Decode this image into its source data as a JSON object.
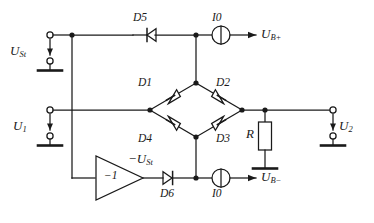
{
  "diagram": {
    "type": "circuit-schematic",
    "stroke_color": "#1a1a1a",
    "background": "#ffffff"
  },
  "labels": {
    "u_st": "U",
    "u_st_sub": "St",
    "u_1": "U",
    "u_1_sub": "1",
    "u_2": "U",
    "u_2_sub": "2",
    "u_b_plus": "U",
    "u_b_plus_sub": "B+",
    "u_b_minus": "U",
    "u_b_minus_sub": "B−",
    "minus_u_st": "−U",
    "minus_u_st_sub": "St",
    "amp_gain": "−1",
    "resistor": "R",
    "d1": "D1",
    "d2": "D2",
    "d3": "D3",
    "d4": "D4",
    "d5": "D5",
    "d6": "D6",
    "i0_top": "I0",
    "i0_bottom": "I0"
  },
  "components": [
    {
      "name": "d1",
      "kind": "diode",
      "label": "D1",
      "orientation": "down-left"
    },
    {
      "name": "d2",
      "kind": "diode",
      "label": "D2",
      "orientation": "down-right"
    },
    {
      "name": "d3",
      "kind": "diode",
      "label": "D3",
      "orientation": "up-right"
    },
    {
      "name": "d4",
      "kind": "diode",
      "label": "D4",
      "orientation": "up-left"
    },
    {
      "name": "d5",
      "kind": "diode",
      "label": "D5",
      "orientation": "left"
    },
    {
      "name": "d6",
      "kind": "diode",
      "label": "D6",
      "orientation": "right"
    },
    {
      "name": "i0-top",
      "kind": "current-source",
      "label": "I0"
    },
    {
      "name": "i0-bottom",
      "kind": "current-source",
      "label": "I0"
    },
    {
      "name": "resistor-r",
      "kind": "resistor",
      "label": "R"
    },
    {
      "name": "inverting-amplifier",
      "kind": "amplifier",
      "label": "−1"
    }
  ],
  "terminals": [
    {
      "name": "u-st-input",
      "label": "U_St",
      "side": "left"
    },
    {
      "name": "u-1-input",
      "label": "U_1",
      "side": "left"
    },
    {
      "name": "u-2-output",
      "label": "U_2",
      "side": "right"
    },
    {
      "name": "u-b-plus-output",
      "label": "U_B+",
      "side": "right"
    },
    {
      "name": "u-b-minus-output",
      "label": "U_B−",
      "side": "right"
    }
  ]
}
